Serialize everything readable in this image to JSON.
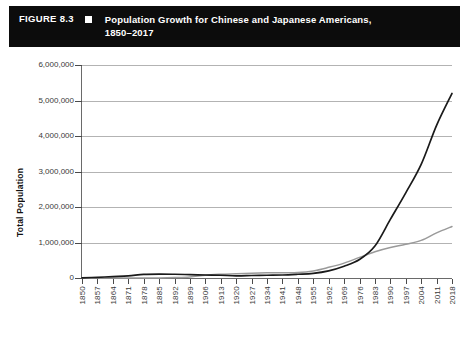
{
  "figure": {
    "number": "FIGURE 8.3",
    "bullet_icon": "square-bullet-icon",
    "title_line1": "Population Growth for Chinese and Japanese Americans,",
    "title_line2": "1850–2017",
    "header_bg": "#0c0c0c",
    "header_fg": "#ffffff"
  },
  "legend": {
    "position": "bottom-center",
    "entries": [
      {
        "label": "Chinese",
        "color": "#1a1a1a"
      },
      {
        "label": "Japanese",
        "color": "#9a9a9a"
      }
    ]
  },
  "chart_data": {
    "type": "line",
    "title": "Population Growth for Chinese and Japanese Americans, 1850–2017",
    "xlabel": "",
    "ylabel": "Total Population",
    "ylim": [
      0,
      6000000
    ],
    "ytick_labels": [
      "0",
      "1,000,000",
      "2,000,000",
      "3,000,000",
      "4,000,000",
      "5,000,000",
      "6,000,000"
    ],
    "ytick_values": [
      0,
      1000000,
      2000000,
      3000000,
      4000000,
      5000000,
      6000000
    ],
    "grid": true,
    "grid_axis": "y",
    "xlim": [
      1850,
      2018
    ],
    "categories": [
      1850,
      1857,
      1864,
      1871,
      1878,
      1885,
      1892,
      1899,
      1906,
      1913,
      1920,
      1927,
      1934,
      1941,
      1948,
      1955,
      1962,
      1969,
      1976,
      1983,
      1990,
      1997,
      2004,
      2011,
      2018
    ],
    "xtick_labels": [
      "1850",
      "1857",
      "1864",
      "1871",
      "1878",
      "1885",
      "1892",
      "1899",
      "1906",
      "1913",
      "1920",
      "1927",
      "1934",
      "1941",
      "1948",
      "1955",
      "1962",
      "1969",
      "1976",
      "1983",
      "1990",
      "1997",
      "2004",
      "2011",
      "2018"
    ],
    "series": [
      {
        "name": "Chinese",
        "color": "#1a1a1a",
        "values": [
          4000,
          20000,
          40000,
          60000,
          100000,
          110000,
          105000,
          95000,
          85000,
          78000,
          62000,
          70000,
          78000,
          85000,
          105000,
          130000,
          200000,
          330000,
          520000,
          900000,
          1650000,
          2400000,
          3200000,
          4300000,
          5200000
        ]
      },
      {
        "name": "Japanese",
        "color": "#9a9a9a",
        "values": [
          0,
          0,
          0,
          1000,
          2000,
          3000,
          12000,
          30000,
          80000,
          105000,
          120000,
          135000,
          145000,
          150000,
          155000,
          200000,
          300000,
          420000,
          580000,
          740000,
          860000,
          950000,
          1060000,
          1270000,
          1450000
        ]
      }
    ]
  }
}
